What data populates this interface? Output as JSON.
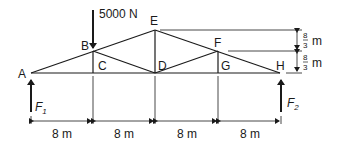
{
  "diagram": {
    "type": "truss",
    "load": {
      "label": "5000 N",
      "at_node": "B",
      "direction": "down"
    },
    "nodes": [
      {
        "id": "A",
        "label": "A"
      },
      {
        "id": "B",
        "label": "B"
      },
      {
        "id": "C",
        "label": "C"
      },
      {
        "id": "D",
        "label": "D"
      },
      {
        "id": "E",
        "label": "E"
      },
      {
        "id": "F",
        "label": "F"
      },
      {
        "id": "G",
        "label": "G"
      },
      {
        "id": "H",
        "label": "H"
      }
    ],
    "reactions": [
      {
        "label": "F",
        "sub": "1",
        "at_node": "A"
      },
      {
        "label": "F",
        "sub": "2",
        "at_node": "H"
      }
    ],
    "spans": [
      "8 m",
      "8 m",
      "8 m",
      "8 m"
    ],
    "heights": [
      {
        "num": "8",
        "den": "3",
        "unit": "m"
      },
      {
        "num": "8",
        "den": "3",
        "unit": "m"
      }
    ]
  }
}
